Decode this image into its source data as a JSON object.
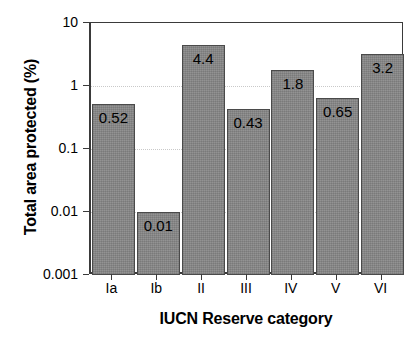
{
  "chart_data": {
    "type": "bar",
    "title": "",
    "xlabel": "IUCN Reserve category",
    "ylabel": "Total area protected (%)",
    "categories": [
      "Ia",
      "Ib",
      "II",
      "III",
      "IV",
      "V",
      "VI"
    ],
    "values": [
      0.52,
      0.01,
      4.4,
      0.43,
      1.8,
      0.65,
      3.2
    ],
    "value_labels": [
      "0.52",
      "0.01",
      "4.4",
      "0.43",
      "1.8",
      "0.65",
      "3.2"
    ],
    "yscale": "log",
    "ylim": [
      0.001,
      10
    ],
    "ytick_labels": [
      "10",
      "1",
      "0.1",
      "0.01",
      "0.001"
    ],
    "ytick_values": [
      10,
      1,
      0.1,
      0.01,
      0.001
    ],
    "grid": "horizontal-dotted",
    "legend": "none",
    "bar_color": "#888888",
    "bar_border_color": "#4a4a4a",
    "axis_color": "#3a3a3a",
    "gridline_color": "#c9c9c9",
    "text_color": "#000000",
    "background": "#ffffff"
  }
}
